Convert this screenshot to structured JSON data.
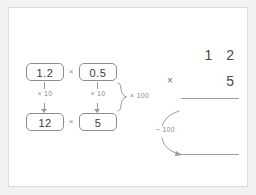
{
  "diagram": {
    "colors": {
      "page_background": "#f2f2f2",
      "card_background": "#ffffff",
      "card_border": "#dcdcdc",
      "chip_border": "#8c8c8c",
      "digit_text": "#4a4a4a",
      "annotation_text": "#8a8a8a",
      "rule_line": "#9e9e9e"
    }
  },
  "left_panel": {
    "top_row": {
      "left_value": "1.2",
      "operator": "×",
      "right_value": "0.5"
    },
    "bottom_row": {
      "left_value": "12",
      "operator": "×",
      "right_value": "5"
    },
    "scaling_arrows": {
      "left_label": "× 10",
      "right_label": "× 10",
      "combined_label": "× 100"
    }
  },
  "right_panel": {
    "multiplicand": "1 2",
    "multiplier": "5",
    "operator": "×",
    "answer": "",
    "undo_scaling_label": "÷ 100"
  }
}
